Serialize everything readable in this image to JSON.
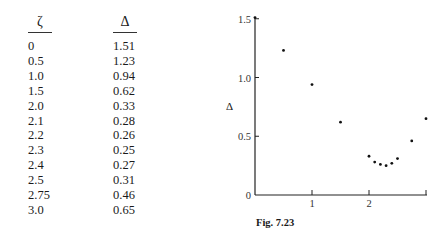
{
  "table": {
    "headers": [
      "ζ",
      "Δ"
    ],
    "rows": [
      [
        "0",
        "1.51"
      ],
      [
        "0.5",
        "1.23"
      ],
      [
        "1.0",
        "0.94"
      ],
      [
        "1.5",
        "0.62"
      ],
      [
        "2.0",
        "0.33"
      ],
      [
        "2.1",
        "0.28"
      ],
      [
        "2.2",
        "0.26"
      ],
      [
        "2.3",
        "0.25"
      ],
      [
        "2.4",
        "0.27"
      ],
      [
        "2.5",
        "0.31"
      ],
      [
        "2.75",
        "0.46"
      ],
      [
        "3.0",
        "0.65"
      ]
    ]
  },
  "figure": {
    "caption": "Fig. 7.23",
    "ylabel": "Δ",
    "y_ticks": [
      "0",
      "0.5",
      "1.0",
      "1.5"
    ],
    "x_ticks": [
      "1",
      "2"
    ]
  },
  "chart_data": {
    "type": "scatter",
    "title": "Fig. 7.23",
    "xlabel": "",
    "ylabel": "Δ",
    "x": [
      0,
      0.5,
      1.0,
      1.5,
      2.0,
      2.1,
      2.2,
      2.3,
      2.4,
      2.5,
      2.75,
      3.0
    ],
    "y": [
      1.51,
      1.23,
      0.94,
      0.62,
      0.33,
      0.28,
      0.26,
      0.25,
      0.27,
      0.31,
      0.46,
      0.65
    ],
    "xlim": [
      0,
      3
    ],
    "ylim": [
      0,
      1.5
    ],
    "x_tick_labels": [
      "1",
      "2"
    ],
    "y_tick_labels": [
      "0",
      "0.5",
      "1.0",
      "1.5"
    ],
    "grid": false,
    "legend": null
  }
}
